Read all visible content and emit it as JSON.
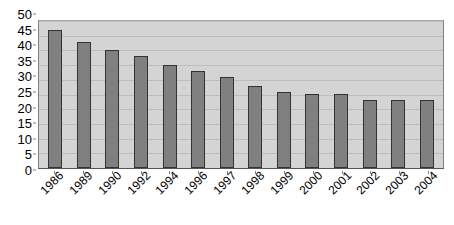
{
  "chart_data": {
    "type": "bar",
    "title": "",
    "subtitle": "",
    "xlabel": "",
    "ylabel": "",
    "categories": [
      "1986",
      "1989",
      "1990",
      "1992",
      "1994",
      "1996",
      "1997",
      "1998",
      "1999",
      "2000",
      "2001",
      "2002",
      "2003",
      "2004"
    ],
    "values": [
      47,
      43,
      40,
      38,
      35,
      33,
      31,
      28,
      26,
      25,
      25,
      23,
      23,
      23
    ],
    "series": [
      {
        "name": "Series 1",
        "values": [
          47,
          43,
          40,
          38,
          35,
          33,
          31,
          28,
          26,
          25,
          25,
          23,
          23,
          23
        ]
      }
    ],
    "ylim": [
      0,
      50
    ],
    "ytick_step": 5,
    "yticks": [
      "50",
      "45",
      "40",
      "35",
      "30",
      "25",
      "20",
      "15",
      "10",
      "5",
      "0"
    ],
    "grid": true,
    "grid_axis": "y",
    "legend": false,
    "legend_position": "none",
    "xtick_rotation": -45,
    "colors": {
      "bar_fill": "#808080",
      "bar_border": "#333333",
      "plot_background": "#d4d4d4",
      "gridline": "#bdbdbd",
      "axis_line": "#808080",
      "text": "#000000",
      "page_background": "#ffffff"
    }
  }
}
